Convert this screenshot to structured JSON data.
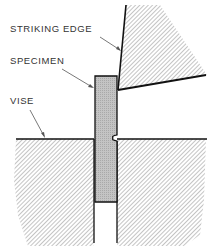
{
  "diagram": {
    "type": "Izod impact test setup",
    "labels": {
      "striking_edge": "STRIKING EDGE",
      "specimen": "SPECIMEN",
      "vise": "VISE"
    },
    "colors": {
      "outline": "#111111",
      "hatch": "#8a8a8a",
      "specimen_fill": "#c4c4c4",
      "leader": "#555555",
      "text": "#333333"
    }
  }
}
